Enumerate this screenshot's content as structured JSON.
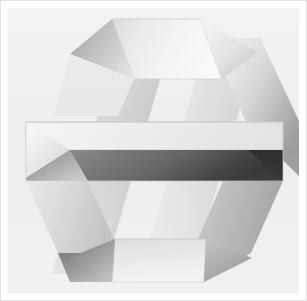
{
  "artwork": {
    "title": "Interlocking Hexagonal Prisms",
    "medium": "3D render",
    "palette": {
      "background": "#eeeeee",
      "mat": "#ffffff",
      "frame_line": "#e3e3e3",
      "highlight": "#fcfcfc",
      "light": "#e9e9e9",
      "mid_light": "#d2d2d2",
      "mid": "#b4b4b4",
      "mid_dark": "#8e8e8e",
      "dark": "#6a6a6a",
      "darkest": "#3c3c3c",
      "edge_line": "#c9c9c9"
    },
    "canvas": {
      "width": 291,
      "height": 285,
      "view_width": 291,
      "view_height": 285
    },
    "figures": [
      {
        "name": "top-hexagonal-prism",
        "description": "Upper hexagonal slab seen from below-left, bright top face with shaded bevels"
      },
      {
        "name": "center-horizontal-slab",
        "description": "Central horizontal band with dark underside face"
      },
      {
        "name": "bottom-hexagonal-prism",
        "description": "Lower hexagonal slab mirrored from the top one"
      },
      {
        "name": "diagonal-ribbons",
        "description": "Two diagonal ribbon bands linking the upper and lower hexagons"
      }
    ],
    "facets": [
      {
        "id": "top-face-main",
        "points": "104,11 192,11 215,40 127,40",
        "fill": "grad-top-face",
        "stroke": "#c9c9c9"
      },
      {
        "id": "top-face-left-bevel",
        "points": "104,11 127,40 60,40",
        "fill": "grad-bevel-left",
        "stroke": "none"
      },
      {
        "id": "top-left-wing",
        "points": "60,40 127,40 98,72 38,72",
        "fill": "grad-wing-left",
        "stroke": "none"
      },
      {
        "id": "top-right-wing",
        "points": "215,40 240,40 212,72 187,72",
        "fill": "grad-wing-right",
        "stroke": "none"
      },
      {
        "id": "mid-slab-top",
        "points": "18,114 275,114 275,142 18,142",
        "fill": "grad-slab-top",
        "stroke": "#c9c9c9"
      },
      {
        "id": "mid-slab-dark",
        "points": "18,142 275,142 275,173 18,173",
        "fill": "grad-slab-dark",
        "stroke": "none"
      },
      {
        "id": "bottom-face-main",
        "points": "107,245 198,245 176,274 85,274",
        "fill": "grad-bottom-face",
        "stroke": "#c9c9c9"
      },
      {
        "id": "ribbon-a",
        "points": "120,40 170,40 108,274 58,274",
        "fill": "grad-ribbon",
        "stroke": "none"
      },
      {
        "id": "ribbon-b",
        "points": "208,40 252,40 190,274 146,274",
        "fill": "grad-ribbon",
        "stroke": "none"
      }
    ],
    "gradients": [
      {
        "id": "grad-top-face",
        "from": "#d4d4d4",
        "to": "#fafafa",
        "angle": 90
      },
      {
        "id": "grad-bevel-left",
        "from": "#9a9a9a",
        "to": "#d8d8d8",
        "angle": 25
      },
      {
        "id": "grad-slab-dark",
        "from": "#9a9a9a",
        "to": "#3c3c3c",
        "angle": 0
      },
      {
        "id": "grad-ribbon",
        "from": "#dedede",
        "to": "#b6b6b6",
        "angle": 90
      }
    ]
  }
}
